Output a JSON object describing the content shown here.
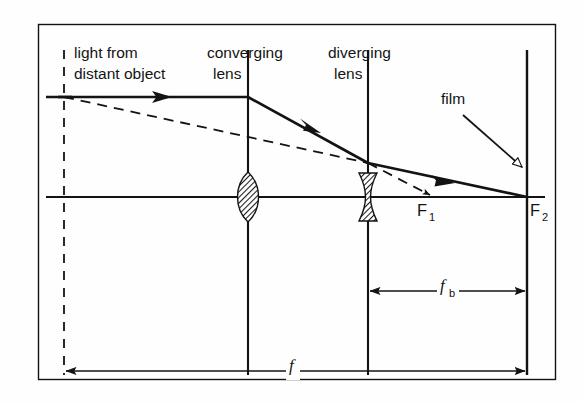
{
  "figure": {
    "background_color": "#fefefe",
    "ink_color": "#131313",
    "frame": {
      "x": 38,
      "y": 24,
      "width": 518,
      "height": 356
    }
  },
  "labels": {
    "light_source_line1": "light from",
    "light_source_line2": "distant object",
    "converging_lens_line1": "converging",
    "converging_lens_line2": "lens",
    "diverging_lens_line1": "diverging",
    "diverging_lens_line2": "lens",
    "film": "film",
    "focal_point_1": "F",
    "focal_point_1_sub": "1",
    "focal_point_2": "F",
    "focal_point_2_sub": "2",
    "back_focal_length": "f",
    "back_focal_length_sub": "b",
    "focal_length": "f"
  },
  "geometry": {
    "optical_axis_y": 197,
    "incident_ray_y": 97,
    "object_plane_x": 64,
    "converging_lens_x": 248,
    "diverging_lens_x": 368,
    "film_plane_x": 527,
    "f1_x": 432,
    "f2_x": 527,
    "crossing_point_x": 368,
    "crossing_point_y": 163,
    "dim_fb_y": 291,
    "dim_f_y": 371
  },
  "elements": {
    "converging_lens_shape": "biconvex-hatched",
    "diverging_lens_shape": "biconcave-hatched",
    "incident_ray_arrow": "right-arrow",
    "refracted_ray_arrow": "down-right-arrow",
    "film_pointer_arrow": "hollow-arrow",
    "dashed_construction_line": "dashed",
    "dimension_arrow_style": "double-headed"
  }
}
